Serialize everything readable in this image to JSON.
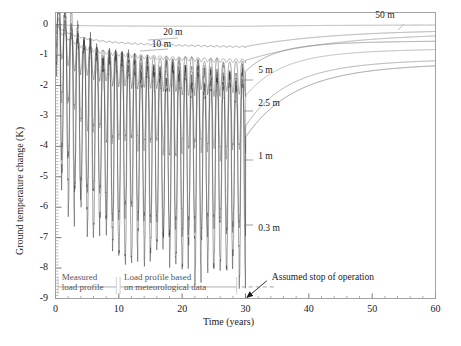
{
  "chart_data": {
    "type": "line",
    "title": "",
    "xlabel": "Time (years)",
    "ylabel": "Ground temperature change (K)",
    "xlim": [
      0,
      60
    ],
    "ylim": [
      -9,
      0.4
    ],
    "xticks": [
      0,
      10,
      20,
      30,
      40,
      50,
      60
    ],
    "xtick_labels": [
      "0",
      "10",
      "20",
      "30",
      "40",
      "50",
      "60"
    ],
    "yticks": [
      0,
      -1,
      -2,
      -3,
      -4,
      -5,
      -6,
      -7,
      -8,
      -9
    ],
    "ytick_labels": [
      "0",
      "-1",
      "-2",
      "-3",
      "-4",
      "-5",
      "-6",
      "-7",
      "-8",
      "-9"
    ],
    "grid": false,
    "minor_ticks": true,
    "legend_position": "inline-annotations",
    "operation_stop_year": 30,
    "series": [
      {
        "name": "50 m",
        "label": "50 m",
        "label_x": 50.5,
        "label_y": 0.27,
        "color": "#999999",
        "trend_end": -0.03,
        "trend_min": -0.06,
        "oscillation_amplitude": 0.0
      },
      {
        "name": "20 m",
        "label": "20 m",
        "label_x": 17.0,
        "label_y": -0.28,
        "color": "#8a8a8a",
        "trend_end": -0.72,
        "trend_min": -0.8,
        "oscillation_amplitude": 0.02
      },
      {
        "name": "10 m",
        "label": "10 m",
        "label_x": 15.2,
        "label_y": -0.66,
        "color": "#909090",
        "trend_end": -1.2,
        "trend_min": -1.3,
        "oscillation_amplitude": 0.06
      },
      {
        "name": "5 m",
        "label": "5 m",
        "label_x": 32.0,
        "label_y": -1.52,
        "color": "#808080",
        "trend_end": -1.55,
        "trend_min": -1.7,
        "oscillation_amplitude": 0.55
      },
      {
        "name": "2.5 m",
        "label": "2.5 m",
        "label_x": 32.0,
        "label_y": -2.6,
        "color": "#6f6f6f",
        "trend_end": -2.3,
        "trend_min": -2.6,
        "oscillation_amplitude": 1.35
      },
      {
        "name": "1 m",
        "label": "1 m",
        "label_x": 32.0,
        "label_y": -4.35,
        "color": "#555555",
        "trend_end": -3.3,
        "trend_min": -3.7,
        "oscillation_amplitude": 2.45
      },
      {
        "name": "0.3 m",
        "label": "0.3 m",
        "label_x": 32.0,
        "label_y": -6.7,
        "color": "#333333",
        "trend_end": -3.7,
        "trend_min": -4.1,
        "oscillation_amplitude": 3.1
      }
    ],
    "annotations": [
      {
        "name": "assumed-stop-of-operation",
        "text": "Assumed stop of operation",
        "x": 30,
        "y": -8.9,
        "text_x": 34.0,
        "text_y": -8.35
      }
    ],
    "legend_notes": [
      {
        "name": "measured-load-profile",
        "line1": "Measured",
        "line2": "load profile",
        "x_start": 0.5,
        "x_end": 9.5
      },
      {
        "name": "load-profile-meteorological",
        "line1": "Load profile based",
        "line2": "on meteorological data",
        "x_start": 10.0,
        "x_end": 30.0
      }
    ]
  }
}
